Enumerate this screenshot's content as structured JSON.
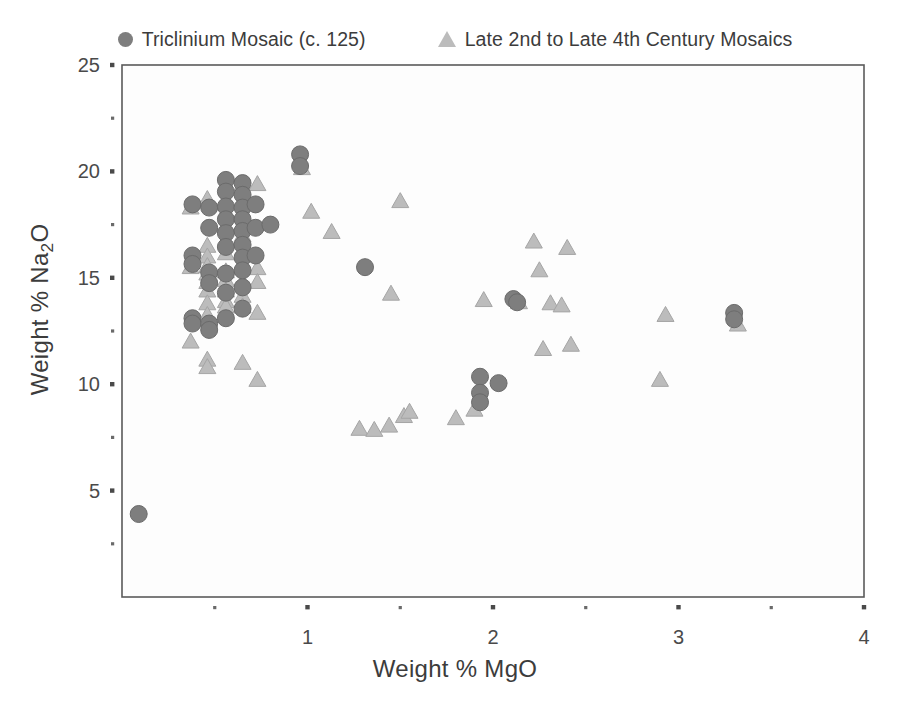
{
  "figure": {
    "background": "#ffffff",
    "plot_area": {
      "left": 122,
      "top": 65,
      "right": 864,
      "bottom": 597
    }
  },
  "legend": {
    "position": "top-center",
    "entries": [
      {
        "label": "Triclinium Mosaic (c. 125)",
        "marker": "circle",
        "color": "#7e7e7e",
        "icon": "filled-circle-icon"
      },
      {
        "label": "Late 2nd to Late 4th Century Mosaics",
        "marker": "triangle",
        "color": "#bcbcbc",
        "icon": "filled-triangle-icon"
      }
    ]
  },
  "axes": {
    "x": {
      "label_plain": "Weight % MgO",
      "label_html": "Weight % MgO",
      "min": 0,
      "max": 4,
      "major_ticks": [
        1,
        2,
        3,
        4
      ],
      "major_tick_labels": [
        "1",
        "2",
        "3",
        "4"
      ],
      "minor_ticks": [
        0.5,
        1.5,
        2.5,
        3.5
      ]
    },
    "y": {
      "label_plain": "Weight % Na2O",
      "label_html": "Weight % Na<sub>2</sub>O",
      "min": 0,
      "max": 25,
      "major_ticks": [
        5,
        10,
        15,
        20,
        25
      ],
      "major_tick_labels": [
        "5",
        "10",
        "15",
        "20",
        "25"
      ],
      "minor_ticks": [
        2.5,
        7.5,
        12.5,
        17.5,
        22.5
      ]
    },
    "frame_color": "#5a5a5a",
    "grid": false
  },
  "chart_data": {
    "type": "scatter",
    "title": "",
    "xlabel": "Weight % MgO",
    "ylabel": "Weight % Na2O",
    "xlim": [
      0,
      4
    ],
    "ylim": [
      0,
      25
    ],
    "grid": false,
    "legend_position": "top-center",
    "series": [
      {
        "name": "Triclinium Mosaic (c. 125)",
        "marker": "circle",
        "color": "#7e7e7e",
        "edge_color": "#6b6b6b",
        "size": 17,
        "points": [
          [
            0.09,
            3.9
          ],
          [
            0.38,
            18.45
          ],
          [
            0.38,
            16.05
          ],
          [
            0.38,
            15.65
          ],
          [
            0.38,
            13.1
          ],
          [
            0.38,
            12.85
          ],
          [
            0.47,
            18.3
          ],
          [
            0.47,
            17.35
          ],
          [
            0.47,
            15.25
          ],
          [
            0.47,
            14.75
          ],
          [
            0.47,
            12.85
          ],
          [
            0.47,
            12.55
          ],
          [
            0.56,
            19.6
          ],
          [
            0.56,
            19.05
          ],
          [
            0.56,
            18.35
          ],
          [
            0.56,
            17.75
          ],
          [
            0.56,
            17.1
          ],
          [
            0.56,
            16.45
          ],
          [
            0.56,
            15.2
          ],
          [
            0.56,
            14.3
          ],
          [
            0.56,
            13.1
          ],
          [
            0.65,
            19.45
          ],
          [
            0.65,
            18.9
          ],
          [
            0.65,
            18.3
          ],
          [
            0.65,
            17.75
          ],
          [
            0.65,
            17.2
          ],
          [
            0.65,
            16.55
          ],
          [
            0.65,
            15.95
          ],
          [
            0.65,
            15.35
          ],
          [
            0.65,
            14.55
          ],
          [
            0.65,
            13.55
          ],
          [
            0.72,
            18.45
          ],
          [
            0.72,
            17.35
          ],
          [
            0.72,
            16.05
          ],
          [
            0.8,
            17.5
          ],
          [
            0.96,
            20.8
          ],
          [
            0.96,
            20.25
          ],
          [
            1.31,
            15.5
          ],
          [
            1.93,
            10.35
          ],
          [
            1.93,
            9.6
          ],
          [
            1.93,
            9.15
          ],
          [
            2.03,
            10.05
          ],
          [
            2.11,
            14.0
          ],
          [
            2.13,
            13.85
          ],
          [
            3.3,
            13.35
          ],
          [
            3.3,
            13.05
          ]
        ]
      },
      {
        "name": "Late 2nd to Late 4th Century Mosaics",
        "marker": "triangle",
        "color": "#bcbcbc",
        "edge_color": "#a5a5a5",
        "size": 17,
        "points": [
          [
            0.37,
            18.35
          ],
          [
            0.37,
            15.55
          ],
          [
            0.37,
            12.05
          ],
          [
            0.46,
            18.75
          ],
          [
            0.46,
            16.55
          ],
          [
            0.46,
            16.05
          ],
          [
            0.46,
            15.6
          ],
          [
            0.46,
            15.25
          ],
          [
            0.46,
            14.85
          ],
          [
            0.46,
            14.45
          ],
          [
            0.46,
            13.85
          ],
          [
            0.46,
            13.3
          ],
          [
            0.46,
            11.2
          ],
          [
            0.46,
            10.85
          ],
          [
            0.56,
            16.2
          ],
          [
            0.56,
            15.35
          ],
          [
            0.56,
            14.95
          ],
          [
            0.56,
            14.45
          ],
          [
            0.56,
            13.95
          ],
          [
            0.56,
            13.7
          ],
          [
            0.65,
            19.45
          ],
          [
            0.65,
            17.05
          ],
          [
            0.65,
            16.2
          ],
          [
            0.65,
            15.55
          ],
          [
            0.65,
            14.85
          ],
          [
            0.65,
            14.2
          ],
          [
            0.65,
            13.7
          ],
          [
            0.65,
            11.05
          ],
          [
            0.73,
            19.45
          ],
          [
            0.73,
            15.5
          ],
          [
            0.73,
            14.85
          ],
          [
            0.73,
            13.4
          ],
          [
            0.73,
            10.25
          ],
          [
            0.97,
            20.2
          ],
          [
            1.02,
            18.15
          ],
          [
            1.13,
            17.2
          ],
          [
            1.28,
            7.95
          ],
          [
            1.36,
            7.9
          ],
          [
            1.44,
            8.1
          ],
          [
            1.45,
            14.3
          ],
          [
            1.5,
            18.65
          ],
          [
            1.52,
            8.55
          ],
          [
            1.55,
            8.75
          ],
          [
            1.8,
            8.45
          ],
          [
            1.9,
            8.85
          ],
          [
            1.95,
            14.0
          ],
          [
            2.14,
            13.9
          ],
          [
            2.22,
            16.75
          ],
          [
            2.25,
            15.4
          ],
          [
            2.27,
            11.7
          ],
          [
            2.31,
            13.85
          ],
          [
            2.37,
            13.75
          ],
          [
            2.4,
            16.45
          ],
          [
            2.42,
            11.9
          ],
          [
            2.9,
            10.25
          ],
          [
            2.93,
            13.3
          ],
          [
            3.32,
            12.85
          ]
        ]
      }
    ]
  }
}
